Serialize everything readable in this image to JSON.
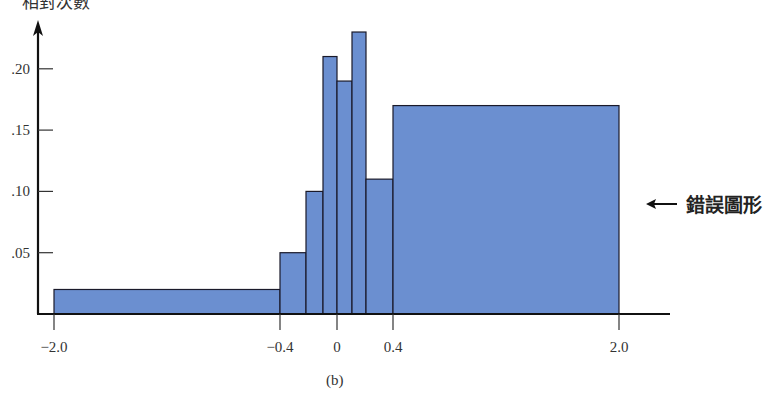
{
  "chart_data": {
    "type": "bar",
    "subtype": "histogram-unequal-widths",
    "title": "",
    "caption": "(b)",
    "xlabel": "",
    "ylabel": "相對次數",
    "annotation": "錯誤圖形",
    "annotation_arrow": "left",
    "bins": [
      {
        "from": -2.0,
        "to": -0.4,
        "value": 0.02
      },
      {
        "from": -0.4,
        "to": -0.2,
        "value": 0.05
      },
      {
        "from": -0.2,
        "to": -0.1,
        "value": 0.1
      },
      {
        "from": -0.1,
        "to": 0.0,
        "value": 0.21
      },
      {
        "from": 0.0,
        "to": 0.1,
        "value": 0.19
      },
      {
        "from": 0.1,
        "to": 0.2,
        "value": 0.23
      },
      {
        "from": 0.2,
        "to": 0.4,
        "value": 0.11
      },
      {
        "from": 0.4,
        "to": 2.0,
        "value": 0.17
      }
    ],
    "x_ticks": [
      -2.0,
      -0.4,
      0,
      0.4,
      2.0
    ],
    "x_tick_labels": [
      "−2.0",
      "−0.4",
      "0",
      "0.4",
      "2.0"
    ],
    "y_ticks": [
      0.05,
      0.1,
      0.15,
      0.2
    ],
    "y_tick_labels": [
      ".05",
      ".10",
      ".15",
      ".20"
    ],
    "ylim": [
      0,
      0.25
    ],
    "grid": false,
    "legend": null,
    "colors": {
      "bar_fill": "#6b8fd0",
      "bar_stroke": "#1a1a2a",
      "axis": "#111111"
    }
  },
  "labels": {
    "ylabel": "相對次數",
    "annotation": "錯誤圖形",
    "caption": "(b)"
  }
}
